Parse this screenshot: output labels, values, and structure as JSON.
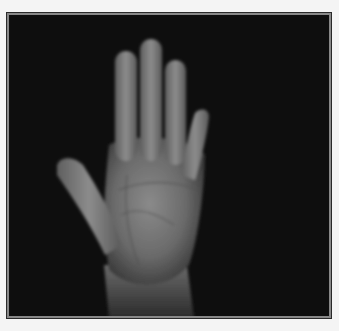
{
  "image": {
    "subject": "open palm of a human hand, fingers extended",
    "style": "grayscale photograph",
    "background": "dark/black",
    "frame": "thin double-line border"
  },
  "colors": {
    "page_background": "#f4f4f4",
    "frame_outer": "#2a2a2a",
    "frame_inner": "#888888",
    "photo_background": "#0e0e0e",
    "skin_light": "#9a9a9a",
    "skin_mid": "#6e6e6e",
    "skin_dark": "#4a4a4a"
  }
}
